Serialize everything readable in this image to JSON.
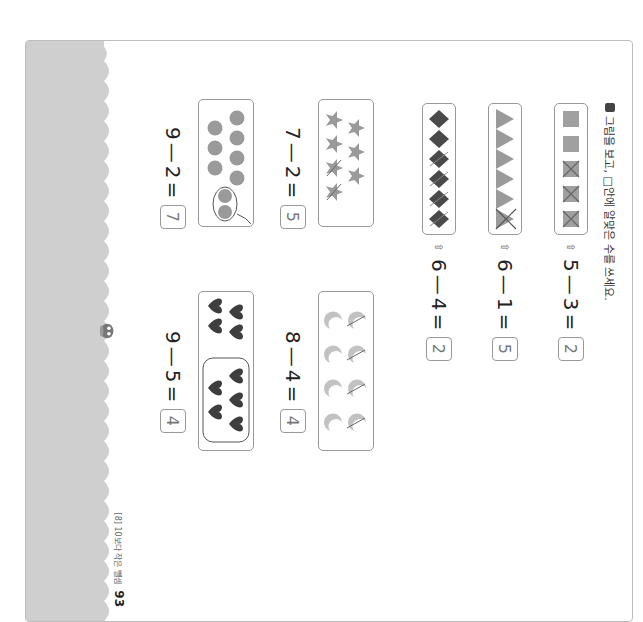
{
  "instruction": {
    "marker": "■",
    "text": "그림을 보고, □안에 알맞은 수를 쓰세요."
  },
  "footer": {
    "section": "[8] 10보다 작은 뺄셈",
    "page_number": "93"
  },
  "colors": {
    "band": "#cfcfcf",
    "shape_gray": "#9a9a9a",
    "shape_dark": "#4a4a4a",
    "moon": "#c2c2c2",
    "answer_border": "#999999"
  },
  "problems": [
    {
      "shape": "square",
      "total": 5,
      "crossed": 3,
      "arrow": "⇧",
      "minuend": "5",
      "subtrahend": "3",
      "equals": "=",
      "answer": "2"
    },
    {
      "shape": "triangle",
      "total": 6,
      "crossed": 1,
      "arrow": "⇧",
      "minuend": "6",
      "subtrahend": "1",
      "equals": "=",
      "answer": "5"
    },
    {
      "shape": "diamond",
      "total": 6,
      "crossed": 4,
      "arrow": "⇧",
      "minuend": "6",
      "subtrahend": "4",
      "equals": "=",
      "answer": "2"
    },
    {
      "shape": "star",
      "total": 7,
      "crossed": 2,
      "minuend": "7",
      "subtrahend": "2",
      "equals": "=",
      "answer": "5"
    },
    {
      "shape": "moon",
      "total": 8,
      "crossed": 4,
      "minuend": "8",
      "subtrahend": "4",
      "equals": "=",
      "answer": "4"
    },
    {
      "shape": "circle",
      "total": 9,
      "circled": 2,
      "minuend": "9",
      "subtrahend": "2",
      "equals": "=",
      "answer": "7"
    },
    {
      "shape": "heart",
      "total": 9,
      "circled": 5,
      "minuend": "9",
      "subtrahend": "5",
      "equals": "=",
      "answer": "4"
    }
  ]
}
